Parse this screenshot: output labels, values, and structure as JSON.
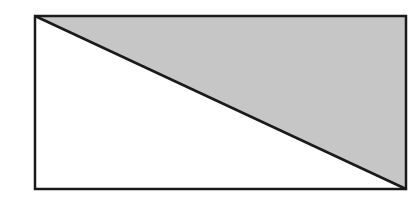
{
  "diagram": {
    "type": "rectangle-with-diagonal",
    "background": "#ffffff",
    "rectangle": {
      "x": 35,
      "y": 16,
      "width": 371,
      "height": 173,
      "stroke": "#1a1a1a",
      "stroke_width": 2.5,
      "fill": "#ffffff"
    },
    "shaded_triangle": {
      "points": "35,16 406,16 406,189",
      "fill": "#c6c6c6",
      "description": "upper-right triangle shaded gray"
    },
    "diagonal": {
      "x1": 35,
      "y1": 16,
      "x2": 406,
      "y2": 189,
      "stroke": "#1a1a1a",
      "stroke_width": 2.5
    }
  }
}
